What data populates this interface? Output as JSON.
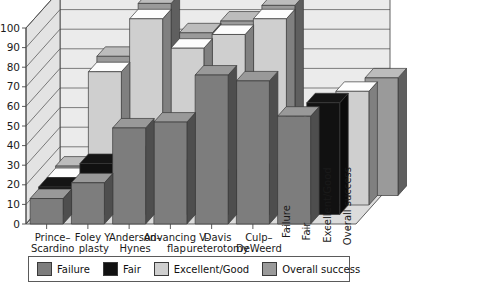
{
  "chart_data": {
    "type": "bar",
    "title": "",
    "subtitle": "",
    "xlabel": "",
    "ylabel": "",
    "ylim": [
      0,
      100
    ],
    "yticks": [
      0,
      10,
      20,
      30,
      40,
      50,
      60,
      70,
      80,
      90,
      100
    ],
    "grid": true,
    "legend_position": "bottom",
    "projection": "3d-grouped",
    "categories": [
      "Prince–Scardino",
      "Foley Y-plasty",
      "Anderson–Hynes",
      "Advancing V-flap",
      "Davis ureterotomy",
      "Culp–DeWeerd"
    ],
    "depth_axis_labels": [
      "Failure",
      "Fair",
      "Excellent/Good",
      "Overall success"
    ],
    "series": [
      {
        "name": "Failure",
        "color": "#7d7d7d",
        "values": [
          13,
          21,
          49,
          52,
          76,
          73
        ]
      },
      {
        "name": "Fair",
        "color": "#111111",
        "values": [
          14,
          26,
          30,
          23,
          18,
          21
        ]
      },
      {
        "name": "Excellent/Good",
        "color": "#cfcfcf",
        "values": [
          14,
          68,
          95,
          80,
          87,
          95
        ]
      },
      {
        "name": "Overall success",
        "color": "#9a9a9a",
        "values": [
          15,
          71,
          98,
          83,
          89,
          97
        ]
      }
    ],
    "aggregate_columns": [
      {
        "name": "Failure",
        "value": 55
      },
      {
        "name": "Fair",
        "value": 57
      },
      {
        "name": "Excellent/Good",
        "value": 58
      },
      {
        "name": "Overall success",
        "value": 60
      }
    ]
  },
  "axis": {
    "y_tick_labels": [
      "0",
      "10",
      "20",
      "30",
      "40",
      "50",
      "60",
      "70",
      "80",
      "90",
      "100"
    ],
    "x_tick_labels": [
      "Prince–",
      "Scardino",
      "Foley Y-",
      "plasty",
      "Anderson–",
      "Hynes",
      "Advancing V-",
      "flap",
      "Davis",
      "ureterotomy",
      "Culp–",
      "DeWeerd"
    ],
    "z_tick_labels": [
      "Failure",
      "Fair",
      "Excellent/Good",
      "Overall success"
    ]
  },
  "legend": {
    "items": [
      {
        "label": "Failure",
        "color": "#7d7d7d"
      },
      {
        "label": "Fair",
        "color": "#111111"
      },
      {
        "label": "Excellent/Good",
        "color": "#cfcfcf"
      },
      {
        "label": "Overall success",
        "color": "#9a9a9a"
      }
    ]
  },
  "colors": {
    "wall_back": "#ebebeb",
    "wall_side": "#e3e3e3",
    "floor": "#dcdcdc",
    "gridline": "#4a4a4a",
    "outline": "#3a3a3a",
    "text": "#1a1a1a"
  }
}
